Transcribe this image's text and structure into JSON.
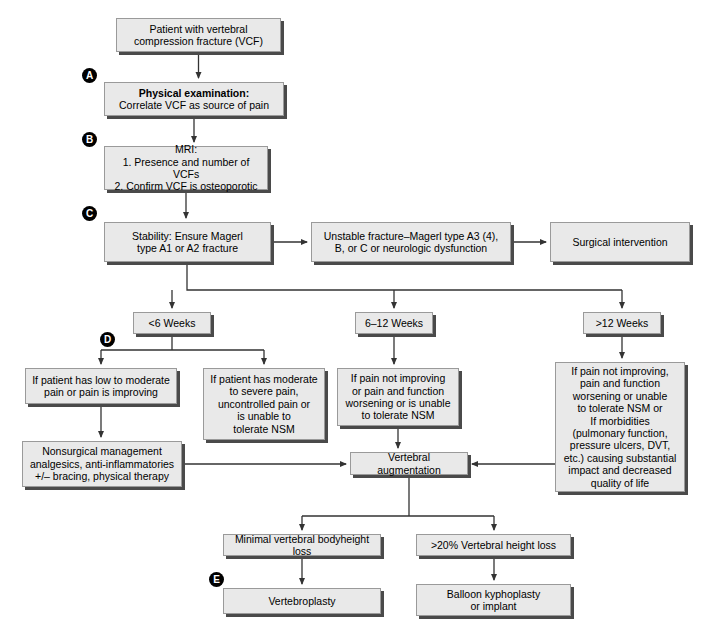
{
  "figure": {
    "type": "flowchart",
    "background_color": "#ffffff",
    "node_fill": "#e9e9e9",
    "node_border": "#9a9a9a",
    "shadow_color": "#4a4a4a",
    "edge_color": "#333333"
  },
  "nodes": [
    {
      "id": "vcf",
      "text": "Patient with vertebral\ncompression fracture (VCF)",
      "x": 116,
      "y": 18,
      "w": 165,
      "h": 34
    },
    {
      "id": "physical_exam",
      "head": "Physical examination:",
      "text": "Correlate VCF as source of pain",
      "x": 104,
      "y": 82,
      "w": 180,
      "h": 34
    },
    {
      "id": "mri",
      "text": "MRI:\n1. Presence and number of VCFs\n2. Confirm VCF is osteoporotic",
      "x": 104,
      "y": 146,
      "w": 164,
      "h": 44
    },
    {
      "id": "stability",
      "text": "Stability: Ensure Magerl\ntype A1 or A2 fracture",
      "x": 104,
      "y": 222,
      "w": 167,
      "h": 40
    },
    {
      "id": "unstable",
      "text": "Unstable fracture–Magerl type A3 (4),\nB, or C or neurologic dysfunction",
      "x": 311,
      "y": 222,
      "w": 200,
      "h": 40
    },
    {
      "id": "surgical",
      "text": "Surgical intervention",
      "x": 550,
      "y": 222,
      "w": 140,
      "h": 40
    },
    {
      "id": "wk_lt6",
      "text": "<6 Weeks",
      "x": 133,
      "y": 312,
      "w": 78,
      "h": 22
    },
    {
      "id": "wk_6_12",
      "text": "6–12 Weeks",
      "x": 355,
      "y": 312,
      "w": 78,
      "h": 22
    },
    {
      "id": "wk_gt12",
      "text": ">12 Weeks",
      "x": 583,
      "y": 312,
      "w": 78,
      "h": 22
    },
    {
      "id": "low_mod",
      "text": "If patient has low to moderate\npain or pain is improving",
      "x": 25,
      "y": 368,
      "w": 152,
      "h": 36
    },
    {
      "id": "mod_severe",
      "text": "If patient has moderate\nto severe pain,\nuncontrolled pain or\nis unable to\ntolerate NSM",
      "x": 203,
      "y": 368,
      "w": 122,
      "h": 72
    },
    {
      "id": "not_improving",
      "text": "If pain not improving\nor pain and function\nworsening or is unable\nto tolerate NSM",
      "x": 337,
      "y": 368,
      "w": 122,
      "h": 58
    },
    {
      "id": "morbidities",
      "text": "If pain not improving,\npain and function\nworsening or unable\nto tolerate NSM or\nIf morbidities\n(pulmonary function,\npressure ulcers, DVT,\netc.) causing substantial\nimpact and decreased\nquality of life",
      "x": 555,
      "y": 362,
      "w": 130,
      "h": 130
    },
    {
      "id": "nonsurgical",
      "text": "Nonsurgical management\nanalgesics, anti-inflammatories\n+/– bracing, physical therapy",
      "x": 22,
      "y": 441,
      "w": 160,
      "h": 46
    },
    {
      "id": "vert_aug",
      "text": "Vertebral augmentation",
      "x": 350,
      "y": 452,
      "w": 118,
      "h": 23
    },
    {
      "id": "minimal_loss",
      "text": "Minimal vertebral bodyheight loss",
      "x": 223,
      "y": 534,
      "w": 158,
      "h": 22
    },
    {
      "id": "gt20_loss",
      "text": ">20% Vertebral height loss",
      "x": 416,
      "y": 534,
      "w": 155,
      "h": 22
    },
    {
      "id": "vertebroplasty",
      "text": "Vertebroplasty",
      "x": 223,
      "y": 588,
      "w": 158,
      "h": 26
    },
    {
      "id": "balloon",
      "text": "Balloon kyphoplasty\nor implant",
      "x": 416,
      "y": 584,
      "w": 155,
      "h": 32
    }
  ],
  "markers": [
    {
      "letter": "A",
      "x": 82,
      "y": 68
    },
    {
      "letter": "B",
      "x": 82,
      "y": 132
    },
    {
      "letter": "C",
      "x": 82,
      "y": 206
    },
    {
      "letter": "D",
      "x": 100,
      "y": 332
    },
    {
      "letter": "E",
      "x": 209,
      "y": 572
    }
  ],
  "edges": [
    {
      "id": "vcf-to-exam",
      "d": "M 198.5 52 L 198.5 78",
      "arrow": true
    },
    {
      "id": "exam-to-mri",
      "d": "M 194 116 L 194 142",
      "arrow": true
    },
    {
      "id": "mri-to-stability",
      "d": "M 186 190 L 186 218",
      "arrow": true
    },
    {
      "id": "stability-to-unstable",
      "d": "M 271 242 L 307 242",
      "arrow": true
    },
    {
      "id": "unstable-to-surgical",
      "d": "M 511 242 L 546 242",
      "arrow": true
    },
    {
      "id": "stability-down-bus",
      "d": "M 187 262 L 187 290 L 622 290",
      "arrow": false
    },
    {
      "id": "bus-to-wk-lt6",
      "d": "M 172 290 L 172 308",
      "arrow": true
    },
    {
      "id": "bus-to-wk-6-12",
      "d": "M 394 290 L 394 308",
      "arrow": true
    },
    {
      "id": "bus-to-wk-gt12",
      "d": "M 622 290 L 622 308",
      "arrow": true
    },
    {
      "id": "wk-lt6-split",
      "d": "M 172 334 L 172 350 M 101 350 L 264 350",
      "arrow": false
    },
    {
      "id": "split-to-low-mod",
      "d": "M 101 350 L 101 364",
      "arrow": true
    },
    {
      "id": "split-to-mod-severe",
      "d": "M 264 350 L 264 364",
      "arrow": true
    },
    {
      "id": "wk-6-12-down",
      "d": "M 394 334 L 394 364",
      "arrow": true
    },
    {
      "id": "wk-gt12-down",
      "d": "M 622 334 L 622 358",
      "arrow": true
    },
    {
      "id": "low-mod-to-nonsurgical",
      "d": "M 101 404 L 101 437",
      "arrow": true
    },
    {
      "id": "nonsurgical-to-aug",
      "d": "M 182 464 L 346 464",
      "arrow": true
    },
    {
      "id": "not-improving-to-aug",
      "d": "M 398 426 L 398 448",
      "arrow": true
    },
    {
      "id": "morbidities-to-aug",
      "d": "M 555 464 L 472 464",
      "arrow": true
    },
    {
      "id": "aug-split",
      "d": "M 409 475 L 409 516 M 302 516 L 494 516",
      "arrow": false
    },
    {
      "id": "split-to-minimal",
      "d": "M 302 516 L 302 530",
      "arrow": true
    },
    {
      "id": "split-to-gt20",
      "d": "M 494 516 L 494 530",
      "arrow": true
    },
    {
      "id": "minimal-to-vertebroplasty",
      "d": "M 302 556 L 302 584",
      "arrow": true
    },
    {
      "id": "gt20-to-balloon",
      "d": "M 494 556 L 494 580",
      "arrow": true
    }
  ]
}
